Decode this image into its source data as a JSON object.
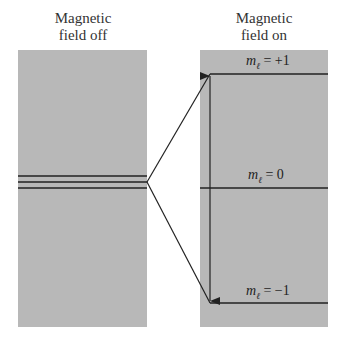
{
  "titles": {
    "left": [
      "Magnetic",
      "field off"
    ],
    "right": [
      "Magnetic",
      "field on"
    ]
  },
  "levels": [
    {
      "symbol": "m",
      "subscript": "ℓ",
      "value": "= +1"
    },
    {
      "symbol": "m",
      "subscript": "ℓ",
      "value": "= 0"
    },
    {
      "symbol": "m",
      "subscript": "ℓ",
      "value": "= −1"
    }
  ],
  "colors": {
    "panel": "#b8b8b8",
    "line": "#222222"
  }
}
